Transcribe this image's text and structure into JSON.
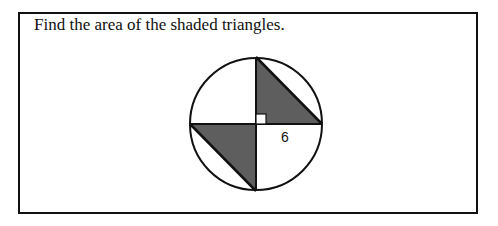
{
  "problem": {
    "prompt": "Find the area of the shaded triangles.",
    "figure": {
      "radius_label": "6",
      "shape": "circle with two shaded right triangles",
      "right_angle_marker": true
    }
  },
  "colors": {
    "shade": "#5e5e5e",
    "stroke": "#111111"
  }
}
